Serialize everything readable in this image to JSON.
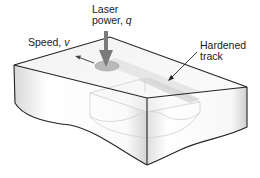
{
  "diagram": {
    "type": "isometric-block",
    "labels": {
      "laser_line1": "Laser",
      "laser_line2": "power, ",
      "laser_symbol": "q",
      "speed_text": "Speed, ",
      "speed_symbol": "v",
      "track_line1": "Hardened",
      "track_line2": "track"
    },
    "colors": {
      "outline": "#222222",
      "spot": "#b8b8b8",
      "arrow": "#777777",
      "track": "#d9d9d9",
      "cutaway": "#cfcfcf"
    }
  }
}
